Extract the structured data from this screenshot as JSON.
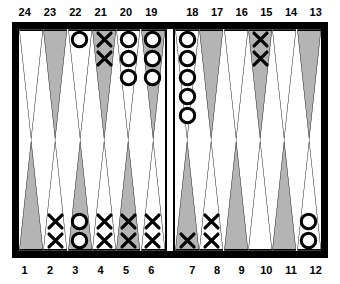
{
  "board": {
    "type": "backgammon-board",
    "colors": {
      "frame": "#000000",
      "field": "#ffffff",
      "point_light": "#ffffff",
      "point_dark": "#b4b4b4",
      "point_outline": "#000000",
      "checker_outline": "#000000"
    },
    "top_labels_left": [
      "24",
      "23",
      "22",
      "21",
      "20",
      "19"
    ],
    "top_labels_right": [
      "18",
      "17",
      "16",
      "15",
      "14",
      "13"
    ],
    "bottom_labels_left": [
      "1",
      "2",
      "3",
      "4",
      "5",
      "6"
    ],
    "bottom_labels_right": [
      "7",
      "8",
      "9",
      "10",
      "11",
      "12"
    ],
    "quadrants": {
      "top_left": [
        {
          "point": "24",
          "shade": "light",
          "checker": "none",
          "count": 0
        },
        {
          "point": "23",
          "shade": "dark",
          "checker": "none",
          "count": 0
        },
        {
          "point": "22",
          "shade": "light",
          "checker": "circle",
          "count": 1
        },
        {
          "point": "21",
          "shade": "dark",
          "checker": "cross",
          "count": 2
        },
        {
          "point": "20",
          "shade": "light",
          "checker": "circle",
          "count": 3
        },
        {
          "point": "19",
          "shade": "dark",
          "checker": "circle",
          "count": 3
        }
      ],
      "top_right": [
        {
          "point": "18",
          "shade": "light",
          "checker": "circle",
          "count": 5
        },
        {
          "point": "17",
          "shade": "dark",
          "checker": "none",
          "count": 0
        },
        {
          "point": "16",
          "shade": "light",
          "checker": "none",
          "count": 0
        },
        {
          "point": "15",
          "shade": "dark",
          "checker": "cross",
          "count": 2
        },
        {
          "point": "14",
          "shade": "light",
          "checker": "none",
          "count": 0
        },
        {
          "point": "13",
          "shade": "dark",
          "checker": "none",
          "count": 0
        }
      ],
      "bottom_left": [
        {
          "point": "1",
          "shade": "dark",
          "checker": "none",
          "count": 0
        },
        {
          "point": "2",
          "shade": "light",
          "checker": "cross",
          "count": 2
        },
        {
          "point": "3",
          "shade": "dark",
          "checker": "circle",
          "count": 2
        },
        {
          "point": "4",
          "shade": "light",
          "checker": "cross",
          "count": 2
        },
        {
          "point": "5",
          "shade": "dark",
          "checker": "cross",
          "count": 2
        },
        {
          "point": "6",
          "shade": "light",
          "checker": "cross",
          "count": 2
        }
      ],
      "bottom_right": [
        {
          "point": "7",
          "shade": "dark",
          "checker": "cross",
          "count": 1
        },
        {
          "point": "8",
          "shade": "light",
          "checker": "cross",
          "count": 2
        },
        {
          "point": "9",
          "shade": "dark",
          "checker": "none",
          "count": 0
        },
        {
          "point": "10",
          "shade": "light",
          "checker": "none",
          "count": 0
        },
        {
          "point": "11",
          "shade": "dark",
          "checker": "none",
          "count": 0
        },
        {
          "point": "12",
          "shade": "light",
          "checker": "circle",
          "count": 2
        }
      ]
    }
  }
}
